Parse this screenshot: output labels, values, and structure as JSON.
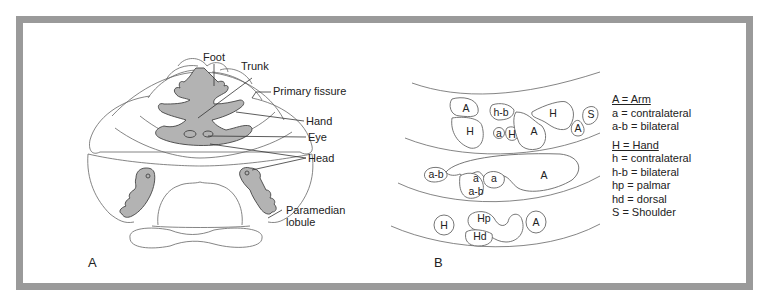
{
  "panels": {
    "a": {
      "label": "A",
      "annotations": {
        "foot": "Foot",
        "trunk": "Trunk",
        "primary_fissure": "Primary fissure",
        "hand": "Hand",
        "eye": "Eye",
        "head": "Head",
        "paramedian_line1": "Paramedian",
        "paramedian_line2": "lobule"
      }
    },
    "b": {
      "label": "B",
      "regions": {
        "top": [
          "A",
          "H",
          "h-b",
          "a",
          "H",
          "A",
          "H",
          "A",
          "S"
        ],
        "middle": [
          "a-b",
          "a",
          "a-b",
          "a",
          "A"
        ],
        "bottom": [
          "H",
          "Hp",
          "Hd",
          "A"
        ]
      },
      "legend": {
        "arm_header": "A = Arm",
        "arm_items": [
          "a = contralateral",
          "a-b = bilateral"
        ],
        "hand_header": "H = Hand",
        "hand_items": [
          "h = contralateral",
          "h-b = bilateral",
          "hp = palmar",
          "hd = dorsal",
          "S = Shoulder"
        ]
      }
    }
  },
  "colors": {
    "frame": "#9a9a9a",
    "somatotopic_fill": "#b3b3b3",
    "outline": "#555555"
  }
}
